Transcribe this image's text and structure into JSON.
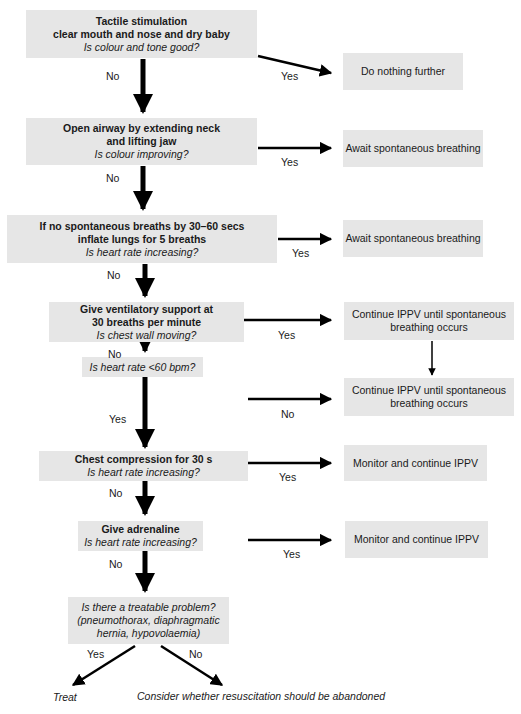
{
  "flowchart": {
    "steps": [
      {
        "title_lines": [
          "Tactile stimulation",
          "clear mouth and nose and dry baby"
        ],
        "question": "Is colour and tone good?"
      },
      {
        "title_lines": [
          "Open airway by extending neck",
          "and lifting jaw"
        ],
        "question": "Is colour improving?"
      },
      {
        "title_lines": [
          "If no spontaneous breaths by 30–60 secs",
          "inflate lungs for 5 breaths"
        ],
        "question": "Is heart rate increasing?"
      },
      {
        "title_lines": [
          "Give ventilatory support at",
          "30 breaths per minute"
        ],
        "question": "Is chest wall moving?"
      },
      {
        "title_lines": [],
        "question": "Is heart rate <60 bpm?"
      },
      {
        "title_lines": [
          "Chest compression for 30 s"
        ],
        "question": "Is heart rate increasing?"
      },
      {
        "title_lines": [
          "Give adrenaline"
        ],
        "question": "Is heart rate increasing?"
      },
      {
        "title_lines": [],
        "question_lines": [
          "Is there a treatable problem?",
          "(pneumothorax, diaphragmatic",
          "hernia, hypovolaemia)"
        ]
      }
    ],
    "outcomes": [
      {
        "lines": [
          "Do nothing further"
        ]
      },
      {
        "lines": [
          "Await spontaneous breathing"
        ]
      },
      {
        "lines": [
          "Await spontaneous breathing"
        ]
      },
      {
        "lines": [
          "Continue IPPV until spontaneous",
          "breathing  occurs"
        ]
      },
      {
        "lines": [
          "Continue IPPV until spontaneous",
          "breathing occurs"
        ]
      },
      {
        "lines": [
          "Monitor and continue IPPV"
        ]
      },
      {
        "lines": [
          "Monitor and continue IPPV"
        ]
      }
    ],
    "branch_labels": {
      "yes": "Yes",
      "no": "No"
    },
    "final": {
      "treat": "Treat",
      "abandon": "Consider whether resuscitation should be abandoned"
    }
  }
}
